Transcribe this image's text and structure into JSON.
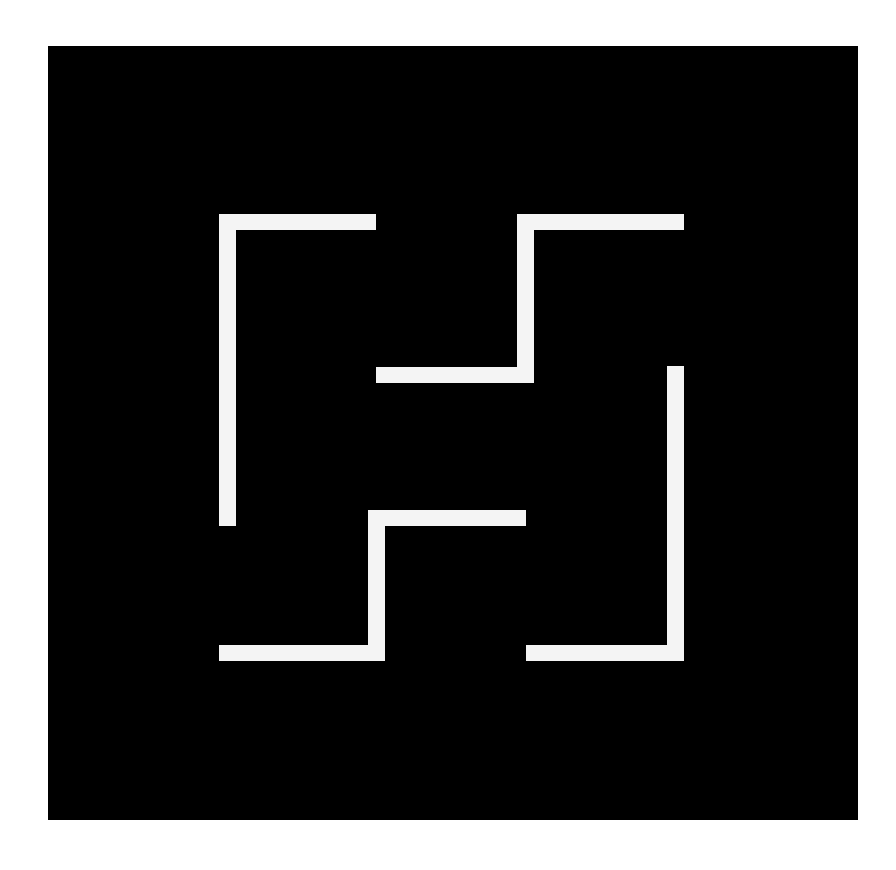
{
  "canvas": {
    "width": 896,
    "height": 870,
    "background": "#ffffff"
  },
  "panel": {
    "x": 48,
    "y": 46,
    "width": 810,
    "height": 774,
    "color": "#000000"
  },
  "stroke_color": "#f4f4f4",
  "shapes": [
    {
      "name": "top-left-corner",
      "bars": [
        {
          "x": 219,
          "y": 214,
          "w": 17,
          "h": 312
        },
        {
          "x": 219,
          "y": 214,
          "w": 157,
          "h": 16
        }
      ]
    },
    {
      "name": "upper-step",
      "bars": [
        {
          "x": 376,
          "y": 367,
          "w": 158,
          "h": 16
        },
        {
          "x": 517,
          "y": 214,
          "w": 17,
          "h": 169
        },
        {
          "x": 517,
          "y": 214,
          "w": 167,
          "h": 16
        }
      ]
    },
    {
      "name": "lower-step",
      "bars": [
        {
          "x": 368,
          "y": 510,
          "w": 158,
          "h": 16
        },
        {
          "x": 368,
          "y": 510,
          "w": 17,
          "h": 151
        },
        {
          "x": 219,
          "y": 645,
          "w": 166,
          "h": 16
        }
      ]
    },
    {
      "name": "bottom-right-corner",
      "bars": [
        {
          "x": 667,
          "y": 366,
          "w": 17,
          "h": 295
        },
        {
          "x": 526,
          "y": 645,
          "w": 158,
          "h": 16
        }
      ]
    }
  ]
}
